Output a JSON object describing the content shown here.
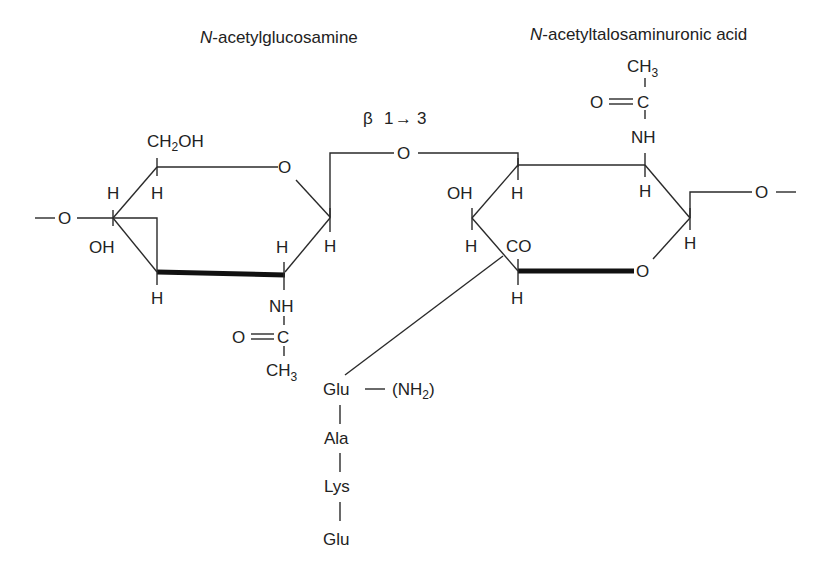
{
  "titles": {
    "left_sugar": {
      "italic_prefix": "N",
      "rest": "-acetylglucosamine"
    },
    "right_sugar": {
      "italic_prefix": "N",
      "rest": "-acetyltalosaminuronic acid"
    }
  },
  "linkage": {
    "label": "β 1→ 3",
    "beta": "β",
    "from": "1",
    "arrow": "→",
    "to": "3"
  },
  "left_ring": {
    "ring_oxygen": "O",
    "substituents": {
      "c6": {
        "main": "CH",
        "sub": "2",
        "tail": "OH"
      },
      "h_c5": "H",
      "h_c4_top": "H",
      "oh_c4": "OH",
      "h_c3": "H",
      "h_c2": "H",
      "h_c1": "H",
      "left_link_oxygen": "O",
      "nh": "NH",
      "carbonyl_o": "O",
      "carbonyl_c": "C",
      "methyl": {
        "main": "CH",
        "sub": "3"
      }
    }
  },
  "bridge_oxygen": "O",
  "right_ring": {
    "ring_oxygen": "O",
    "substituents": {
      "oh_c4": "OH",
      "h_c3": "H",
      "h_c4": "H",
      "co": "CO",
      "h_c5": "H",
      "h_c2": "H",
      "h_c1": "H",
      "right_link_oxygen": "O",
      "nh": "NH",
      "carbonyl_o": "O",
      "carbonyl_c": "C",
      "methyl": {
        "main": "CH",
        "sub": "3"
      }
    }
  },
  "peptide": {
    "residues": [
      "Glu",
      "Ala",
      "Lys",
      "Glu"
    ],
    "amide": {
      "prefix": "(NH",
      "sub": "2",
      "suffix": ")"
    }
  }
}
